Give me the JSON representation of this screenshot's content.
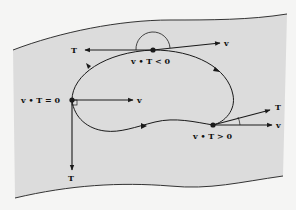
{
  "diagram": {
    "surface_fill": "#dcdcdc",
    "background": "#f5f5f4",
    "stroke": "#1a1a1a",
    "points": [
      {
        "id": "top",
        "condition": "v • T < 0",
        "vector_v_label": "v",
        "vector_T_label": "T",
        "angle_marker": "semicircle (obtuse angle)"
      },
      {
        "id": "left",
        "condition": "v • T = 0",
        "vector_v_label": "v",
        "vector_T_label": "T",
        "angle_marker": "right-angle square"
      },
      {
        "id": "right",
        "condition": "v • T > 0",
        "vector_v_label": "v",
        "vector_T_label": "T",
        "angle_marker": "small arc (acute angle)"
      }
    ]
  }
}
